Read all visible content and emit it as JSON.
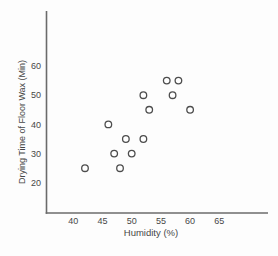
{
  "figure": {
    "background": "#fdfdfd",
    "axis_color": "#6b6b6b",
    "text_color": "#474747",
    "marker_stroke": "#4d4d4d",
    "marker_fill": "#ffffff"
  },
  "chart_data": {
    "type": "scatter",
    "title": "",
    "xlabel": "Humidity (%)",
    "ylabel": "Drying Time of Floor Wax (Min)",
    "x_ticks": [
      40,
      45,
      50,
      55,
      60,
      65
    ],
    "y_ticks": [
      20,
      30,
      40,
      50,
      60
    ],
    "xlim": [
      35,
      73
    ],
    "ylim": [
      10,
      79
    ],
    "grid": false,
    "legend": "none",
    "marker": "open-circle",
    "points": [
      {
        "x": 42,
        "y": 25
      },
      {
        "x": 46,
        "y": 40
      },
      {
        "x": 47,
        "y": 30
      },
      {
        "x": 48,
        "y": 25
      },
      {
        "x": 49,
        "y": 35
      },
      {
        "x": 50,
        "y": 30
      },
      {
        "x": 52,
        "y": 35
      },
      {
        "x": 52,
        "y": 50
      },
      {
        "x": 53,
        "y": 45
      },
      {
        "x": 56,
        "y": 55
      },
      {
        "x": 57,
        "y": 50
      },
      {
        "x": 58,
        "y": 55
      },
      {
        "x": 60,
        "y": 45
      }
    ]
  }
}
